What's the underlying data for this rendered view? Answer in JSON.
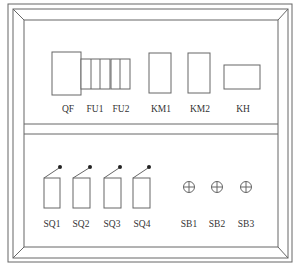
{
  "diagram": {
    "type": "electrical control panel layout",
    "upper_panel": {
      "components": [
        {
          "id": "QF",
          "label": "QF",
          "shape": "square"
        },
        {
          "id": "FU1",
          "label": "FU1",
          "shape": "fuse-block-3"
        },
        {
          "id": "FU2",
          "label": "FU2",
          "shape": "fuse-block-2"
        },
        {
          "id": "KM1",
          "label": "KM1",
          "shape": "tall-rect"
        },
        {
          "id": "KM2",
          "label": "KM2",
          "shape": "tall-rect"
        },
        {
          "id": "KH",
          "label": "KH",
          "shape": "wide-rect"
        }
      ]
    },
    "lower_panel": {
      "components": [
        {
          "id": "SQ1",
          "label": "SQ1",
          "shape": "limit-switch"
        },
        {
          "id": "SQ2",
          "label": "SQ2",
          "shape": "limit-switch"
        },
        {
          "id": "SQ3",
          "label": "SQ3",
          "shape": "limit-switch"
        },
        {
          "id": "SQ4",
          "label": "SQ4",
          "shape": "limit-switch"
        },
        {
          "id": "SB1",
          "label": "SB1",
          "shape": "push-button"
        },
        {
          "id": "SB2",
          "label": "SB2",
          "shape": "push-button"
        },
        {
          "id": "SB3",
          "label": "SB3",
          "shape": "push-button"
        }
      ]
    }
  },
  "colors": {
    "line": "#666666",
    "text": "#333333",
    "background": "#ffffff"
  }
}
